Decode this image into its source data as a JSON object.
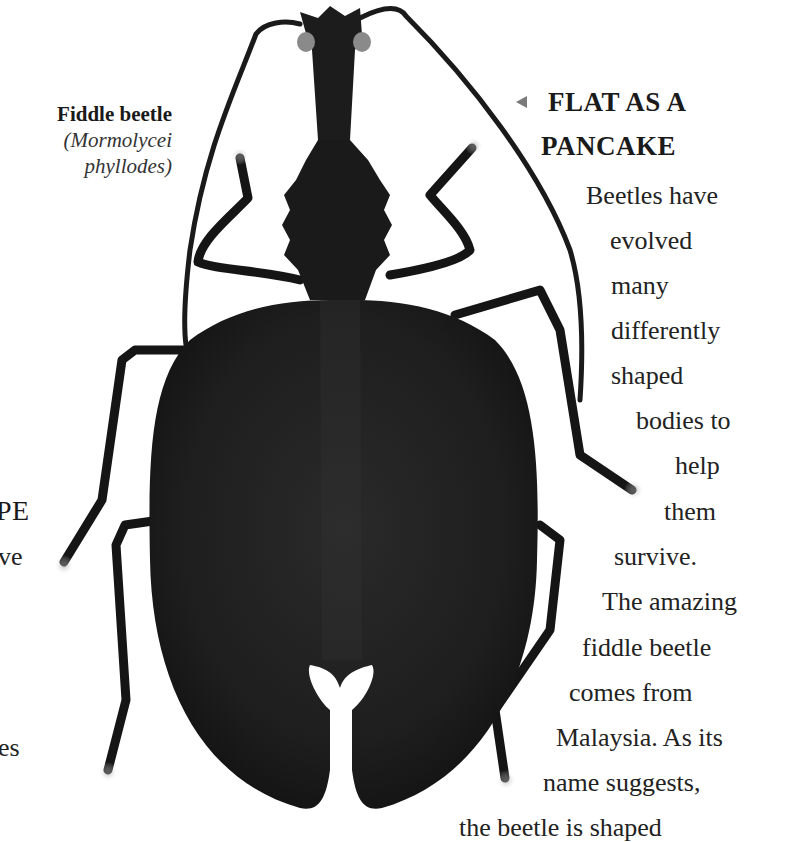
{
  "caption": {
    "common_name": "Fiddle beetle",
    "latin_line1": "(Mormolycei",
    "latin_line2": "phyllodes)"
  },
  "feature": {
    "pointer_icon": "left-triangle-pointer",
    "heading_line1": "FLAT AS A",
    "heading_line2": "PANCAKE",
    "body_lines": [
      "Beetles have",
      "evolved",
      "many",
      "differently",
      "shaped",
      "bodies to",
      "help",
      "them",
      "survive.",
      "The amazing",
      "fiddle beetle",
      "comes from",
      "Malaysia. As its",
      "name suggests,",
      "the beetle is shaped"
    ]
  },
  "left_edge_fragments": {
    "heading_fragment": "PE",
    "body_fragment_1": "ve",
    "body_fragment_2": "es"
  },
  "image": {
    "subject": "fiddle beetle specimen photo, top view",
    "body_color": "#1c1c1c",
    "background_color": "#ffffff"
  }
}
